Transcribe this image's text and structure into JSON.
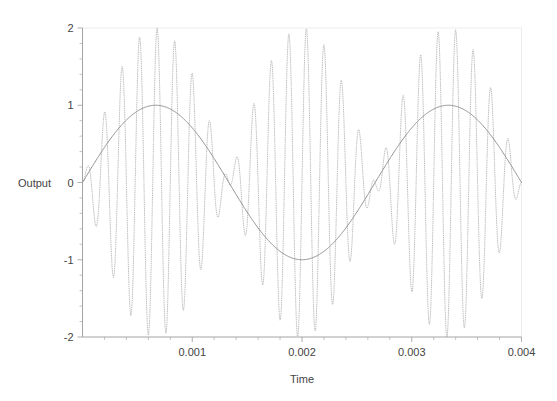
{
  "chart_data": {
    "type": "line",
    "title": "",
    "subtitle": "",
    "xlabel": "Time",
    "ylabel": "Output",
    "xlim": [
      0,
      0.004
    ],
    "ylim": [
      -2,
      2
    ],
    "grid": false,
    "legend": null,
    "legend_position": "none",
    "x_ticks": [
      0.001,
      0.002,
      0.003,
      0.004
    ],
    "x_tick_labels": [
      "0.001",
      "0.002",
      "0.003",
      "0.004"
    ],
    "y_ticks": [
      -2,
      -1,
      0,
      1,
      2
    ],
    "y_tick_labels": [
      "-2",
      "-1",
      "0",
      "1",
      "2"
    ],
    "x_minor_tick_count": 5,
    "y_minor_tick_count": 5,
    "series": [
      {
        "name": "carrier",
        "style": "dotted",
        "color": "#b4b4b4",
        "description": "amplitude-modulated carrier, envelope times carrier, peak magnitude 2",
        "model": {
          "kind": "am_product",
          "carrier_frequency_hz": 6250,
          "carrier_phase_rad": 0,
          "modulation_frequency_hz": 375,
          "modulation_phase_rad": 0,
          "peak_amplitude": 2.0
        }
      },
      {
        "name": "envelope",
        "style": "solid",
        "color": "#8c8c8c",
        "description": "slow modulating sine envelope, peak magnitude 1",
        "model": {
          "kind": "modulation_envelope",
          "frequency_hz": 375,
          "phase_rad": 0,
          "peak_amplitude": 1.0
        }
      }
    ],
    "sample_count": 1200
  },
  "axes": {
    "y_axis_label": "Output",
    "x_axis_label": "Time"
  }
}
